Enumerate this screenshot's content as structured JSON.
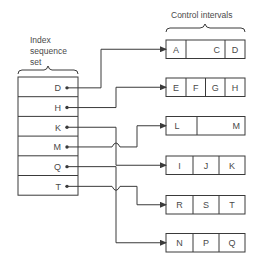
{
  "index_set": {
    "label_lines": [
      "Index",
      "sequence",
      "set"
    ],
    "entries": [
      "D",
      "H",
      "K",
      "M",
      "Q",
      "T"
    ]
  },
  "control_intervals": {
    "label": "Control intervals",
    "rows": [
      [
        "A",
        "",
        "C",
        "D"
      ],
      [
        "E",
        "F",
        "G",
        "H"
      ],
      [
        "L",
        "",
        "M"
      ],
      [
        "I",
        "J",
        "K"
      ],
      [
        "R",
        "S",
        "T"
      ],
      [
        "N",
        "P",
        "Q"
      ]
    ]
  },
  "pointers": [
    {
      "from": "D",
      "to_row": 0
    },
    {
      "from": "H",
      "to_row": 1
    },
    {
      "from": "K",
      "to_row": 3
    },
    {
      "from": "M",
      "to_row": 2
    },
    {
      "from": "Q",
      "to_row": 5
    },
    {
      "from": "T",
      "to_row": 4
    }
  ],
  "colors": {
    "line": "#3a3a3a",
    "text": "#4a4a4a"
  }
}
